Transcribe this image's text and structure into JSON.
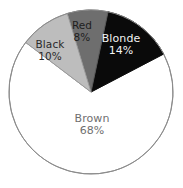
{
  "chart_data": {
    "type": "pie",
    "title": "",
    "subtitle": "",
    "xlabel": "",
    "ylabel": "",
    "legend_position": "none",
    "labels_inside_slices": true,
    "start_angle_deg": 12,
    "direction": "clockwise",
    "categories": [
      "Blonde",
      "Brown",
      "Black",
      "Red"
    ],
    "values": [
      14,
      68,
      10,
      8
    ],
    "value_unit": "%",
    "slices": [
      {
        "name": "Blonde",
        "value": 14,
        "value_label": "14%",
        "fill": "#0a0a0a",
        "text_color": "#f2f2f2",
        "stroke": "#0a0a0a"
      },
      {
        "name": "Brown",
        "value": 68,
        "value_label": "68%",
        "fill": "#ffffff",
        "text_color": "#6f6f6f",
        "stroke": "#8c8c8c"
      },
      {
        "name": "Black",
        "value": 10,
        "value_label": "10%",
        "fill": "#bdbdbd",
        "text_color": "#2a2a2a",
        "stroke": "#9a9a9a"
      },
      {
        "name": "Red",
        "value": 8,
        "value_label": "8%",
        "fill": "#6e6e6e",
        "text_color": "#1e1e1e",
        "stroke": "#5a5a5a"
      }
    ],
    "geometry": {
      "center_x": 91,
      "center_y": 92,
      "radius": 82
    },
    "background": "#ffffff"
  }
}
